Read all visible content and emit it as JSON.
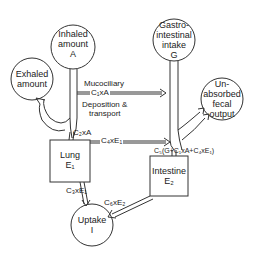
{
  "nodes": {
    "inhaled": {
      "line1": "Inhaled",
      "line2": "amount",
      "line3": "A"
    },
    "exhaled": {
      "line1": "Exhaled",
      "line2": "amount"
    },
    "gastro": {
      "line1": "Gastro-",
      "line2": "intestinal",
      "line3": "intake",
      "line4": "G"
    },
    "unabsorbed": {
      "line1": "Un-",
      "line2": "absorbed",
      "line3": "fecal",
      "line4": "output"
    },
    "lung": {
      "line1": "Lung",
      "line2": "E₁"
    },
    "intestine": {
      "line1": "Intestine",
      "line2": "E₂"
    },
    "uptake": {
      "line1": "Uptake",
      "line2": "I"
    }
  },
  "flows": {
    "mucociliary": "Mucociliary",
    "c1a": "C₁xA",
    "deposition": "Deposition &",
    "transport": "transport",
    "c2a": "C₂xA",
    "c4e1": "C₄xE₁",
    "c5": "C₅(G+C₁xA+C₄xE₁)",
    "c3e1": "C₃xE₁",
    "c6e2": "C₆xE₂"
  }
}
